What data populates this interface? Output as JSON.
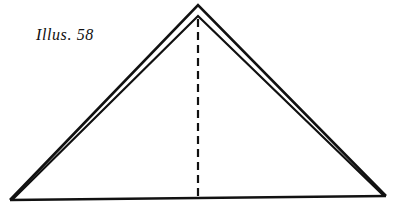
{
  "figure": {
    "caption": "Illus. 58",
    "background_color": "#ffffff",
    "ink_color": "#111111",
    "canvas": {
      "width": 395,
      "height": 207
    },
    "outer_triangle": {
      "name": "outer-triangle-outline",
      "apex": {
        "x": 198,
        "y": 5
      },
      "left_base": {
        "x": 10,
        "y": 200
      },
      "right_base": {
        "x": 386,
        "y": 196
      },
      "stroke_width": 2.6
    },
    "inner_triangle": {
      "name": "inner-triangle-outline",
      "apex": {
        "x": 198,
        "y": 16
      },
      "left_base": {
        "x": 12,
        "y": 200
      },
      "right_base": {
        "x": 384,
        "y": 196
      },
      "stroke_width": 2.2
    },
    "base_line": {
      "name": "triangle-base-line",
      "start": {
        "x": 10,
        "y": 200
      },
      "end": {
        "x": 386,
        "y": 196
      },
      "stroke_width": 2.6
    },
    "fold_line": {
      "name": "dashed-center-fold-line",
      "start": {
        "x": 198,
        "y": 19
      },
      "end": {
        "x": 198,
        "y": 198
      },
      "stroke_width": 2.2,
      "dash_length": 8,
      "gap_length": 5
    }
  }
}
